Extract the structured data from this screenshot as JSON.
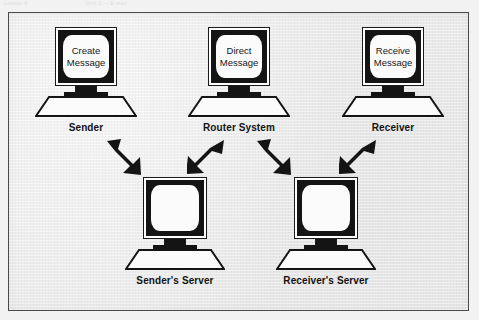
{
  "scan_header": {
    "left_text": "Lesson 4",
    "right_text": "Unit 2 — E-mail"
  },
  "figure": {
    "background_color": "#e9e9e9",
    "border_color": "#4a4a4a",
    "ink_color": "#141414"
  },
  "nodes": {
    "top": [
      {
        "id": "sender",
        "label": "Sender",
        "screen_lines": [
          "Create",
          "Message"
        ]
      },
      {
        "id": "router-system",
        "label": "Router System",
        "screen_lines": [
          "Direct",
          "Message"
        ]
      },
      {
        "id": "receiver",
        "label": "Receiver",
        "screen_lines": [
          "Receive",
          "Message"
        ]
      }
    ],
    "bottom": [
      {
        "id": "senders-server",
        "label": "Sender's Server",
        "screen_lines": [
          "",
          ""
        ]
      },
      {
        "id": "receivers-server",
        "label": "Receiver's Server",
        "screen_lines": [
          "",
          ""
        ]
      }
    ]
  },
  "arrows": [
    {
      "id": "sender-to-senders-server",
      "direction": "down-right",
      "from": "Sender",
      "to": "Sender's Server"
    },
    {
      "id": "senders-server-to-router",
      "direction": "up-right",
      "from": "Sender's Server",
      "to": "Router System"
    },
    {
      "id": "router-to-receivers-server",
      "direction": "down-right",
      "from": "Router System",
      "to": "Receiver's Server"
    },
    {
      "id": "receivers-server-to-receiver",
      "direction": "up-right",
      "from": "Receiver's Server",
      "to": "Receiver"
    }
  ]
}
